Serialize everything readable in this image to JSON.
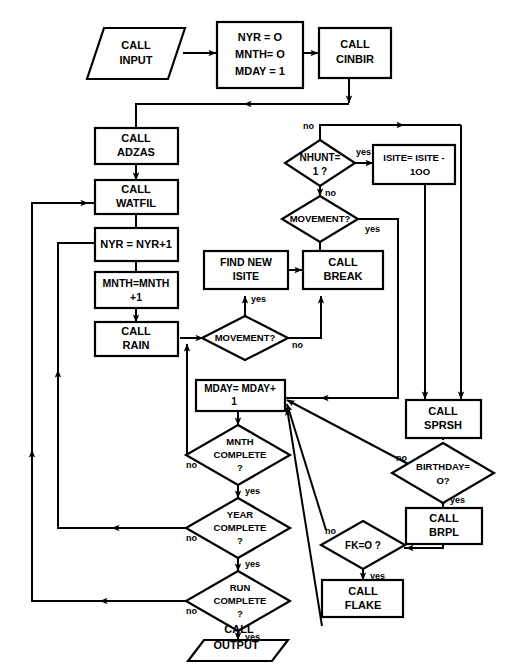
{
  "diagram": {
    "style": {
      "line_color": "#000000",
      "fill_color": "#ffffff",
      "text_color": "#000000"
    },
    "nodes": [
      {
        "id": "call_input",
        "shape": "parallelogram",
        "lines": [
          "CALL",
          "INPUT"
        ]
      },
      {
        "id": "init",
        "shape": "rect",
        "lines": [
          "NYR = O",
          "MNTH= O",
          "MDAY = 1"
        ]
      },
      {
        "id": "call_cinbir",
        "shape": "rect",
        "lines": [
          "CALL",
          "CINBIR"
        ]
      },
      {
        "id": "call_adzas",
        "shape": "rect",
        "lines": [
          "CALL",
          "ADZAS"
        ]
      },
      {
        "id": "call_watfil",
        "shape": "rect",
        "lines": [
          "CALL",
          "WATFIL"
        ]
      },
      {
        "id": "nyr_inc",
        "shape": "rect",
        "lines": [
          "NYR = NYR+1"
        ]
      },
      {
        "id": "mnth_inc",
        "shape": "rect",
        "lines": [
          "MNTH=MNTH",
          "+1"
        ]
      },
      {
        "id": "call_rain",
        "shape": "rect",
        "lines": [
          "CALL",
          "RAIN"
        ]
      },
      {
        "id": "nhunt",
        "shape": "diamond",
        "lines": [
          "NHUNT=",
          "1 ?"
        ]
      },
      {
        "id": "isite",
        "shape": "rect",
        "lines": [
          "ISITE= ISITE -",
          "1OO"
        ]
      },
      {
        "id": "movement_top",
        "shape": "diamond",
        "lines": [
          "MOVEMENT?"
        ]
      },
      {
        "id": "find_new",
        "shape": "rect",
        "lines": [
          "FIND NEW",
          "ISITE"
        ]
      },
      {
        "id": "call_break",
        "shape": "rect",
        "lines": [
          "CALL",
          "BREAK"
        ]
      },
      {
        "id": "movement_mid",
        "shape": "diamond",
        "lines": [
          "MOVEMENT?"
        ]
      },
      {
        "id": "mday_inc",
        "shape": "rect",
        "lines": [
          "MDAY= MDAY+",
          "1"
        ]
      },
      {
        "id": "mnth_complete",
        "shape": "diamond",
        "lines": [
          "MNTH",
          "COMPLETE",
          "?"
        ]
      },
      {
        "id": "year_complete",
        "shape": "diamond",
        "lines": [
          "YEAR",
          "COMPLETE",
          "?"
        ]
      },
      {
        "id": "run_complete",
        "shape": "diamond",
        "lines": [
          "RUN",
          "COMPLETE",
          "?"
        ]
      },
      {
        "id": "call_output",
        "shape": "parallelogram",
        "lines": [
          "CALL",
          "OUTPUT"
        ]
      },
      {
        "id": "call_sprsh",
        "shape": "rect",
        "lines": [
          "CALL",
          "SPRSH"
        ]
      },
      {
        "id": "birthday",
        "shape": "diamond",
        "lines": [
          "BIRTHDAY=",
          "O?"
        ]
      },
      {
        "id": "call_brpl",
        "shape": "rect",
        "lines": [
          "CALL",
          "BRPL"
        ]
      },
      {
        "id": "fk",
        "shape": "diamond",
        "lines": [
          "FK=O ?"
        ]
      },
      {
        "id": "call_flake",
        "shape": "rect",
        "lines": [
          "CALL",
          "FLAKE"
        ]
      }
    ],
    "edge_labels": [
      {
        "id": "nhunt_no",
        "text": "no"
      },
      {
        "id": "nhunt_yes",
        "text": "yes"
      },
      {
        "id": "movement_top_no",
        "text": "no"
      },
      {
        "id": "movement_top_yes",
        "text": "yes"
      },
      {
        "id": "movement_mid_yes",
        "text": "yes"
      },
      {
        "id": "movement_mid_no",
        "text": "no"
      },
      {
        "id": "mnth_no",
        "text": "no"
      },
      {
        "id": "mnth_yes",
        "text": "yes"
      },
      {
        "id": "year_no",
        "text": "no"
      },
      {
        "id": "year_yes",
        "text": "yes"
      },
      {
        "id": "run_no",
        "text": "no"
      },
      {
        "id": "run_yes",
        "text": "yes"
      },
      {
        "id": "birthday_no",
        "text": "no"
      },
      {
        "id": "birthday_yes",
        "text": "yes"
      },
      {
        "id": "fk_no",
        "text": "no"
      },
      {
        "id": "fk_yes",
        "text": "yes"
      }
    ]
  }
}
